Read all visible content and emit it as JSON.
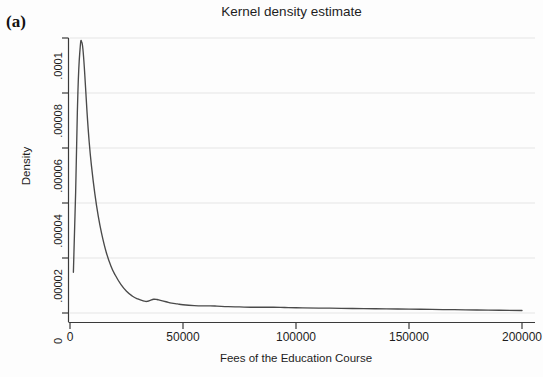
{
  "panel": {
    "label": "(a)"
  },
  "chart_data": {
    "type": "line",
    "title": "Kernel density estimate",
    "subtitle": "",
    "xlabel": "Fees of the Education Course",
    "ylabel": "Density",
    "xlim": [
      0,
      200000
    ],
    "ylim": [
      0,
      0.0001
    ],
    "grid": "horizontal",
    "legend": "none",
    "xticks": [
      0,
      50000,
      100000,
      150000,
      200000
    ],
    "xtick_labels": [
      "0",
      "50000",
      "100000",
      "150000",
      "200000"
    ],
    "yticks": [
      0,
      2e-05,
      4e-05,
      6e-05,
      8e-05,
      0.0001
    ],
    "ytick_labels": [
      "0",
      ".00002",
      ".00004",
      ".00006",
      ".00008",
      ".0001"
    ],
    "line_color": "#4a4a4a",
    "series": [
      {
        "name": "Kernel density",
        "x": [
          1500,
          2500,
          3500,
          4500,
          5200,
          5800,
          6500,
          7500,
          8500,
          9500,
          11000,
          12500,
          14000,
          16000,
          18000,
          20000,
          22500,
          25000,
          27500,
          30000,
          32500,
          34000,
          35500,
          37000,
          38500,
          40000,
          42500,
          45000,
          47500,
          50000,
          55000,
          60000,
          62000,
          65000,
          70000,
          75000,
          80000,
          85000,
          90000,
          95000,
          100000,
          110000,
          120000,
          130000,
          140000,
          150000,
          160000,
          170000,
          180000,
          190000,
          200000
        ],
        "y": [
          1.48e-05,
          4.4e-05,
          8.04e-05,
          9.65e-05,
          9.85e-05,
          9.52e-05,
          8.72e-05,
          7.35e-05,
          6.21e-05,
          5.35e-05,
          4.33e-05,
          3.52e-05,
          2.89e-05,
          2.22e-05,
          1.73e-05,
          1.38e-05,
          1.04e-05,
          7.9e-06,
          6.2e-06,
          5.1e-06,
          4.4e-06,
          4.2e-06,
          4.6e-06,
          5e-06,
          4.9e-06,
          4.6e-06,
          4.1e-06,
          3.6e-06,
          3.3e-06,
          3e-06,
          2.7e-06,
          2.6e-06,
          2.6e-06,
          2.5e-06,
          2.3e-06,
          2.2e-06,
          2.1e-06,
          2.1e-06,
          2.1e-06,
          2e-06,
          1.9e-06,
          1.8e-06,
          1.7e-06,
          1.6e-06,
          1.5e-06,
          1.4e-06,
          1.3e-06,
          1.2e-06,
          1.1e-06,
          1e-06,
          9e-07
        ]
      }
    ]
  }
}
